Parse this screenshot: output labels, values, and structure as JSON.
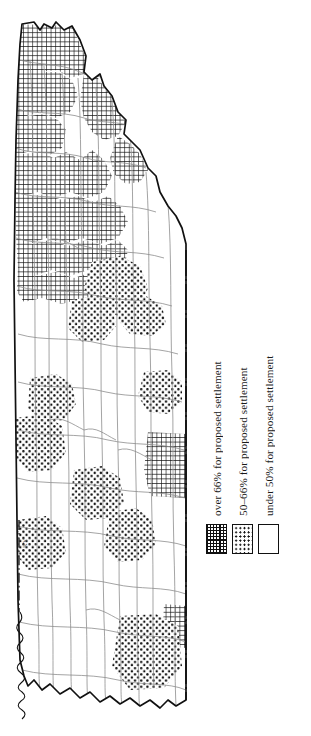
{
  "figure": {
    "kind": "choropleth-county-map",
    "orientation": "rotated-90-degrees"
  },
  "map": {
    "name": "county-referendum-map",
    "boundary_label_left": "KY"
  },
  "legend": {
    "name": "map-legend",
    "items": [
      {
        "swatch": "dense-crosshatch-swatch",
        "pattern": "grid",
        "label": "over 66% for proposed settlement"
      },
      {
        "swatch": "sparse-dot-swatch",
        "pattern": "dots",
        "label": "50–66% for proposed settlement"
      },
      {
        "swatch": "blank-white-swatch",
        "pattern": "blank",
        "label": "under 50% for proposed settlement"
      }
    ]
  },
  "colors": {
    "ink": "#111111",
    "paper": "#ffffff",
    "county_line": "#8d8d8d"
  }
}
